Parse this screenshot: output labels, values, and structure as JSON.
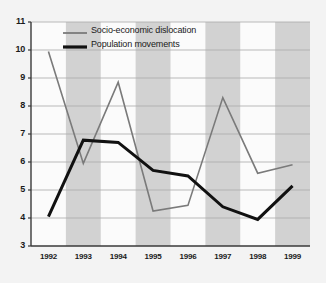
{
  "chart_data": {
    "type": "line",
    "title": "",
    "xlabel": "",
    "ylabel": "",
    "categories": [
      "1992",
      "1993",
      "1994",
      "1995",
      "1996",
      "1997",
      "1998",
      "1999"
    ],
    "x": [
      1992,
      1993,
      1994,
      1995,
      1996,
      1997,
      1998,
      1999
    ],
    "ylim": [
      3,
      11
    ],
    "yticks": [
      3,
      4,
      5,
      6,
      7,
      8,
      9,
      10,
      11
    ],
    "grid": true,
    "legend_position": "top-left-inside",
    "banded_background": true,
    "series": [
      {
        "name": "Socio-economic dislocation",
        "color": "#7a7a7a",
        "line_width": 1.6,
        "values": [
          9.95,
          5.95,
          8.85,
          4.25,
          4.45,
          8.3,
          5.6,
          5.9
        ]
      },
      {
        "name": "Population movements",
        "color": "#111111",
        "line_width": 3.0,
        "values": [
          4.05,
          6.78,
          6.7,
          5.7,
          5.5,
          4.4,
          3.95,
          5.15
        ]
      }
    ]
  },
  "axes": {
    "y_tick_labels": [
      "11",
      "10",
      "9",
      "8",
      "7",
      "6",
      "5",
      "4",
      "3"
    ],
    "x_tick_labels": [
      "1992",
      "1993",
      "1994",
      "1995",
      "1996",
      "1997",
      "1998",
      "1999"
    ]
  },
  "legend": {
    "entries": [
      {
        "label": "Socio-economic dislocation",
        "swatch": "gray-line-swatch"
      },
      {
        "label": "Population movements",
        "swatch": "black-line-swatch"
      }
    ]
  },
  "colors": {
    "page_background": "#f3f3f3",
    "plot_background": "#fbfbfb",
    "band_fill": "#d2d2d2",
    "gridline": "#a9a9a9",
    "axis_line": "#3a3a3a",
    "series_gray": "#7a7a7a",
    "series_black": "#111111",
    "text": "#1a1a1a"
  }
}
